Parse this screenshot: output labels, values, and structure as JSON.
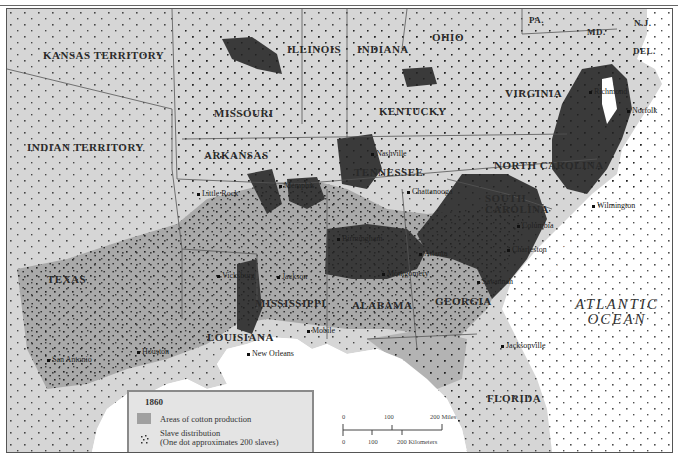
{
  "map": {
    "title_year": "1860",
    "colors": {
      "land": "#d6d6d6",
      "cotton_area": "#a9a9a9",
      "dense_region": "#3a3a3a",
      "water": "#ffffff",
      "border": "#555555",
      "dot": "#222222"
    },
    "regions": [
      {
        "name": "KANSAS TERRITORY"
      },
      {
        "name": "INDIAN TERRITORY"
      },
      {
        "name": "MISSOURI"
      },
      {
        "name": "ILLINOIS"
      },
      {
        "name": "INDIANA"
      },
      {
        "name": "OHIO"
      },
      {
        "name": "PA."
      },
      {
        "name": "N.J."
      },
      {
        "name": "MD."
      },
      {
        "name": "DEL."
      },
      {
        "name": "VIRGINIA"
      },
      {
        "name": "KENTUCKY"
      },
      {
        "name": "ARKANSAS"
      },
      {
        "name": "TENNESSEE"
      },
      {
        "name": "NORTH CAROLINA"
      },
      {
        "name": "SOUTH CAROLINA"
      },
      {
        "name": "TEXAS"
      },
      {
        "name": "MISSISSIPPI"
      },
      {
        "name": "ALABAMA"
      },
      {
        "name": "GEORGIA"
      },
      {
        "name": "LOUISIANA"
      },
      {
        "name": "FLORIDA"
      }
    ],
    "cities": [
      {
        "name": "Richmond"
      },
      {
        "name": "Norfolk"
      },
      {
        "name": "Nashville"
      },
      {
        "name": "Chattanooga"
      },
      {
        "name": "Wilmington"
      },
      {
        "name": "Little Rock"
      },
      {
        "name": "Memphis"
      },
      {
        "name": "Columbia"
      },
      {
        "name": "Birmingham"
      },
      {
        "name": "Atlanta"
      },
      {
        "name": "Charleston"
      },
      {
        "name": "Vicksburg"
      },
      {
        "name": "Jackson"
      },
      {
        "name": "Montgomery"
      },
      {
        "name": "Savannah"
      },
      {
        "name": "Jacksonville"
      },
      {
        "name": "Mobile"
      },
      {
        "name": "Houston"
      },
      {
        "name": "San Antonio"
      },
      {
        "name": "New Orleans"
      }
    ],
    "water_labels": {
      "ocean_line1": "ATLANTIC",
      "ocean_line2": "OCEAN",
      "sea_island": "SEA ISLAND COTTON"
    }
  },
  "legend": {
    "year": "1860",
    "items": [
      {
        "label": "Areas of cotton production",
        "icon": "gray-swatch"
      },
      {
        "label_line1": "Slave distribution",
        "label_line2": "(One dot approximates 200 slaves)",
        "icon": "dot-cluster"
      }
    ]
  },
  "scale_bar": {
    "miles": {
      "ticks": [
        "0",
        "100",
        "200 Miles"
      ]
    },
    "kilometers": {
      "ticks": [
        "0",
        "100",
        "200 Kilometers"
      ]
    }
  }
}
